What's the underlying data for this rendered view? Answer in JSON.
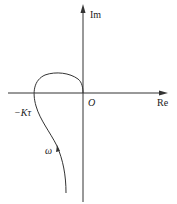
{
  "axes": {
    "real_label": "Re",
    "imag_label": "Im",
    "origin_label": "O"
  },
  "annotations": {
    "intercept_label": "−Kτ",
    "frequency_label": "ω"
  },
  "colors": {
    "line": "#333333",
    "background": "#ffffff"
  }
}
